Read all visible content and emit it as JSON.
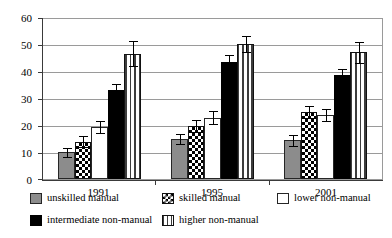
{
  "chart_data": {
    "type": "bar",
    "title": "",
    "subtitle": "",
    "xlabel": "",
    "ylabel": "",
    "categories": [
      "1991",
      "1995",
      "2001"
    ],
    "ylim": [
      0,
      60
    ],
    "yticks": [
      0,
      10,
      20,
      30,
      40,
      50,
      60
    ],
    "grid": true,
    "legend_position": "bottom-left",
    "series": [
      {
        "name": "unskilled manual",
        "pattern": "solid-grey",
        "color": "#8c8c8c",
        "values": [
          10,
          15,
          14.5
        ],
        "errors": [
          1.8,
          2.0,
          2.0
        ]
      },
      {
        "name": "skilled manual",
        "pattern": "checkerboard",
        "color": "#000000",
        "values": [
          14,
          20,
          25
        ],
        "errors": [
          2.0,
          2.3,
          2.3
        ]
      },
      {
        "name": "lower non-manual",
        "pattern": "white",
        "color": "#ffffff",
        "values": [
          19.5,
          23,
          24
        ],
        "errors": [
          2.2,
          2.4,
          2.4
        ]
      },
      {
        "name": "intermediate non-manual",
        "pattern": "solid-black",
        "color": "#000000",
        "values": [
          33.5,
          44,
          39
        ],
        "errors": [
          2.3,
          2.4,
          2.4
        ]
      },
      {
        "name": "higher non-manual",
        "pattern": "vertical-stripes",
        "color": "#3d3d3d",
        "values": [
          47,
          50.5,
          47.5
        ],
        "errors": [
          4.7,
          3.0,
          4.0
        ]
      }
    ]
  },
  "legend": {
    "items": [
      {
        "label": "unskilled manual",
        "key": "unskilled"
      },
      {
        "label": "skilled manual",
        "key": "skilled"
      },
      {
        "label": "lower non-manual",
        "key": "lower"
      },
      {
        "label": "intermediate non-manual",
        "key": "intermediate"
      },
      {
        "label": "higher non-manual",
        "key": "higher"
      }
    ]
  },
  "axis": {
    "y_tick_labels": [
      "60",
      "50",
      "40",
      "30",
      "20",
      "10",
      "0"
    ],
    "x_tick_labels": [
      "1991",
      "1995",
      "2001"
    ]
  }
}
